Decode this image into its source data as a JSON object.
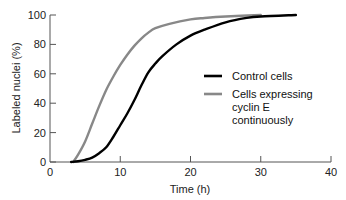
{
  "chart_data": {
    "type": "line",
    "title": "",
    "xlabel": "Time (h)",
    "ylabel": "Labeled nuclei (%)",
    "xlim": [
      0,
      40
    ],
    "ylim": [
      0,
      100
    ],
    "xticks": [
      0,
      10,
      20,
      30,
      40
    ],
    "yticks": [
      0,
      20,
      40,
      60,
      80,
      100
    ],
    "grid": false,
    "legend_position": "right-middle",
    "series": [
      {
        "name": "Control cells",
        "color": "#000000",
        "x": [
          3,
          4,
          5,
          6,
          7,
          8,
          9,
          10,
          11,
          12,
          13,
          14,
          15,
          16,
          18,
          20,
          22,
          25,
          28,
          30,
          35
        ],
        "y": [
          0,
          0.5,
          1.5,
          3,
          6,
          10,
          17,
          25,
          33,
          42,
          52,
          61,
          67,
          72,
          80,
          86,
          90,
          95,
          98,
          99,
          100
        ]
      },
      {
        "name": "Cells expressing cyclin E continuously",
        "color": "#888888",
        "x": [
          3.3,
          4,
          5,
          6,
          7,
          8,
          9,
          10,
          11,
          12,
          13,
          14,
          15,
          17,
          20,
          22,
          25,
          30
        ],
        "y": [
          0,
          5,
          14,
          26,
          38,
          49,
          58,
          66,
          73,
          79,
          84,
          88,
          91,
          94,
          97,
          98,
          99,
          100
        ]
      }
    ]
  }
}
